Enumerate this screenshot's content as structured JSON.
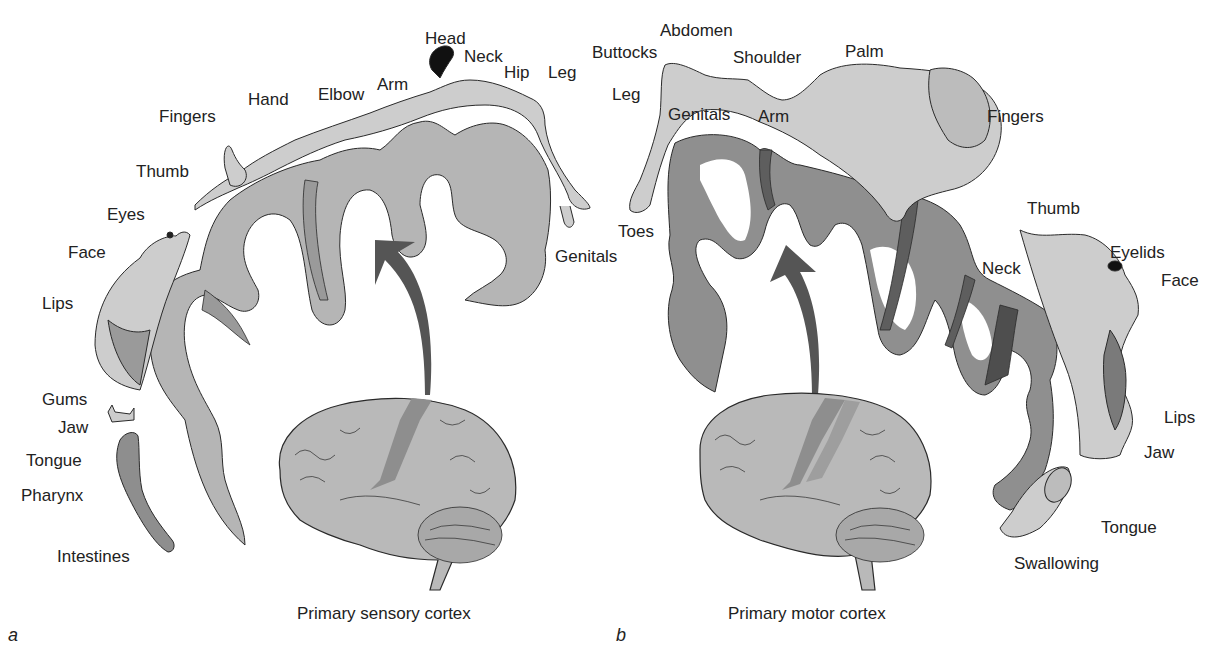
{
  "figure": {
    "panels": [
      {
        "id": "a",
        "letter": "a",
        "caption": "Primary sensory cortex",
        "labels": [
          {
            "text": "Head",
            "x": 425,
            "y": 30
          },
          {
            "text": "Neck",
            "x": 464,
            "y": 48
          },
          {
            "text": "Hip",
            "x": 504,
            "y": 64
          },
          {
            "text": "Leg",
            "x": 548,
            "y": 64
          },
          {
            "text": "Arm",
            "x": 377,
            "y": 76
          },
          {
            "text": "Elbow",
            "x": 318,
            "y": 86
          },
          {
            "text": "Hand",
            "x": 248,
            "y": 91
          },
          {
            "text": "Fingers",
            "x": 159,
            "y": 108
          },
          {
            "text": "Thumb",
            "x": 136,
            "y": 163
          },
          {
            "text": "Eyes",
            "x": 107,
            "y": 206
          },
          {
            "text": "Face",
            "x": 68,
            "y": 244
          },
          {
            "text": "Lips",
            "x": 42,
            "y": 295
          },
          {
            "text": "Gums",
            "x": 42,
            "y": 391
          },
          {
            "text": "Jaw",
            "x": 58,
            "y": 419
          },
          {
            "text": "Tongue",
            "x": 26,
            "y": 452
          },
          {
            "text": "Pharynx",
            "x": 21,
            "y": 487
          },
          {
            "text": "Intestines",
            "x": 57,
            "y": 548
          },
          {
            "text": "Genitals",
            "x": 555,
            "y": 248
          }
        ]
      },
      {
        "id": "b",
        "letter": "b",
        "caption": "Primary motor cortex",
        "labels": [
          {
            "text": "Abdomen",
            "x": 660,
            "y": 22
          },
          {
            "text": "Buttocks",
            "x": 592,
            "y": 44
          },
          {
            "text": "Shoulder",
            "x": 733,
            "y": 49
          },
          {
            "text": "Palm",
            "x": 845,
            "y": 43
          },
          {
            "text": "Leg",
            "x": 612,
            "y": 86
          },
          {
            "text": "Genitals",
            "x": 668,
            "y": 106
          },
          {
            "text": "Arm",
            "x": 758,
            "y": 108
          },
          {
            "text": "Fingers",
            "x": 987,
            "y": 108
          },
          {
            "text": "Thumb",
            "x": 1027,
            "y": 200
          },
          {
            "text": "Toes",
            "x": 618,
            "y": 223
          },
          {
            "text": "Eyelids",
            "x": 1110,
            "y": 244
          },
          {
            "text": "Face",
            "x": 1161,
            "y": 272
          },
          {
            "text": "Neck",
            "x": 982,
            "y": 260
          },
          {
            "text": "Lips",
            "x": 1164,
            "y": 409
          },
          {
            "text": "Jaw",
            "x": 1144,
            "y": 444
          },
          {
            "text": "Tongue",
            "x": 1101,
            "y": 519
          },
          {
            "text": "Swallowing",
            "x": 1014,
            "y": 555
          }
        ]
      }
    ],
    "colors": {
      "cortex_sensory": "#b5b5b5",
      "cortex_motor": "#8f8f8f",
      "cortex_highlight": "#6a6a6a",
      "body_fill": "#cdcdcd",
      "arrow": "#555555",
      "brain_fill": "#b9b9b9",
      "brain_strip": "#8e8e8e",
      "outline": "#2a2a2a"
    }
  }
}
